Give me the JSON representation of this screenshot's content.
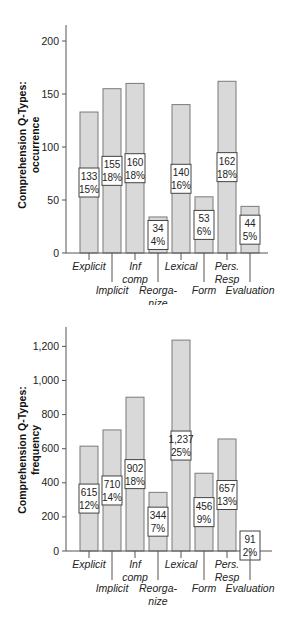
{
  "chart_data": [
    {
      "type": "bar",
      "title": "",
      "ylabel": "Comprehension Q-Types: occurrence",
      "ylabel_lines": [
        "Comprehension Q-Types:",
        "occurrence"
      ],
      "xlabel": "",
      "categories": [
        "Explicit",
        "Implicit",
        "Inf comp",
        "Reorganize",
        "Lexical",
        "Form",
        "Pers. Resp",
        "Evaluation"
      ],
      "category_label_lines": [
        [
          "Explicit"
        ],
        [
          "Implicit"
        ],
        [
          "Inf",
          "comp"
        ],
        [
          "Reorga-",
          "nize"
        ],
        [
          "Lexical"
        ],
        [
          "Form"
        ],
        [
          "Pers.",
          "Resp"
        ],
        [
          "Evaluation"
        ]
      ],
      "values": [
        133,
        155,
        160,
        34,
        140,
        53,
        162,
        44
      ],
      "percent_labels": [
        "15%",
        "18%",
        "18%",
        "4%",
        "16%",
        "6%",
        "18%",
        "5%"
      ],
      "value_labels": [
        "133",
        "155",
        "160",
        "34",
        "140",
        "53",
        "162",
        "44"
      ],
      "yticks": [
        0,
        50,
        100,
        150,
        200
      ],
      "ytick_labels": [
        "0",
        "50",
        "100",
        "150",
        "200"
      ],
      "ylim": [
        0,
        215
      ],
      "grid": false,
      "legend": "none"
    },
    {
      "type": "bar",
      "title": "",
      "ylabel": "Comprehension Q-Types: frequency",
      "ylabel_lines": [
        "Comprehension Q-Types:",
        "frequency"
      ],
      "xlabel": "",
      "categories": [
        "Explicit",
        "Implicit",
        "Inf comp",
        "Reorganize",
        "Lexical",
        "Form",
        "Pers. Resp",
        "Evaluation"
      ],
      "category_label_lines": [
        [
          "Explicit"
        ],
        [
          "Implicit"
        ],
        [
          "Inf",
          "comp"
        ],
        [
          "Reorga-",
          "nize"
        ],
        [
          "Lexical"
        ],
        [
          "Form"
        ],
        [
          "Pers.",
          "Resp"
        ],
        [
          "Evaluation"
        ]
      ],
      "values": [
        615,
        710,
        902,
        344,
        1237,
        456,
        657,
        91
      ],
      "percent_labels": [
        "12%",
        "14%",
        "18%",
        "7%",
        "25%",
        "9%",
        "13%",
        "2%"
      ],
      "value_labels": [
        "615",
        "710",
        "902",
        "344",
        "1,237",
        "456",
        "657",
        "91"
      ],
      "yticks": [
        0,
        200,
        400,
        600,
        800,
        1000,
        1200
      ],
      "ytick_labels": [
        "0",
        "200",
        "400",
        "600",
        "800",
        "1,000",
        "1,200"
      ],
      "ylim": [
        0,
        1320
      ],
      "grid": false,
      "legend": "none"
    }
  ],
  "colors": {
    "bar_fill": "#d9d9d9",
    "bar_stroke": "#7a7a7a",
    "axis": "#555555",
    "box_fill": "#ffffff",
    "box_stroke": "#444444"
  }
}
